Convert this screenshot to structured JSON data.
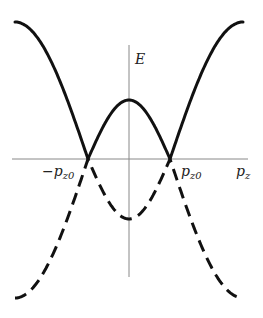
{
  "diagram": {
    "type": "band_structure_plot",
    "axes": {
      "vertical_label": "E",
      "horizontal_label": {
        "base": "p",
        "sub": "z"
      }
    },
    "tick_labels": {
      "left_crossing": {
        "prefix": "−",
        "base": "p",
        "sub": "z0"
      },
      "right_crossing": {
        "base": "p",
        "sub": "z0"
      }
    },
    "curves": [
      {
        "name": "upper-band",
        "style": "solid",
        "description": "max at edges, local max at p_z=0, touches zero at ±p_z0"
      },
      {
        "name": "lower-band",
        "style": "dashed",
        "description": "mirror image of upper band below the axis"
      }
    ],
    "colors": {
      "curve": "#111111",
      "axis": "#888888",
      "background": "#ffffff"
    }
  }
}
